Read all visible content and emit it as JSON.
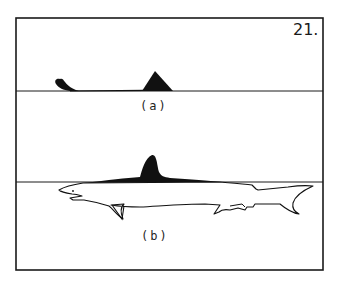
{
  "figure": {
    "number": "21.",
    "panels": [
      {
        "id": "a",
        "label": "(a)",
        "description": "Shark at surface: only dorsal fin and tail fin tip visible above waterline"
      },
      {
        "id": "b",
        "label": "(b)",
        "description": "Side view of shark with body below waterline, dorsal fin and back protruding above"
      }
    ]
  },
  "colors": {
    "ink": "#111111",
    "paper": "#ffffff"
  }
}
